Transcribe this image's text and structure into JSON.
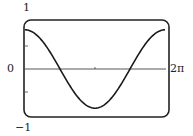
{
  "chart_data": {
    "type": "line",
    "title": "",
    "xlabel": "",
    "ylabel": "",
    "xlim": [
      0,
      6.283
    ],
    "ylim": [
      -1,
      1
    ],
    "x_tick_labels": [
      "0",
      "2π"
    ],
    "y_tick_labels": [
      "1",
      "0",
      "-1"
    ],
    "grid": false,
    "legend": "none",
    "series": [
      {
        "name": "f(x) ≈ 0.8cos(x)",
        "x": [
          0,
          0.785,
          1.571,
          2.356,
          3.142,
          3.927,
          4.712,
          5.498,
          6.283
        ],
        "values": [
          0.8,
          0.57,
          0.0,
          -0.57,
          -0.8,
          -0.57,
          0.0,
          0.57,
          0.8
        ]
      }
    ]
  },
  "labels": {
    "y_max": "1",
    "y_zero": "0",
    "y_min": "−1",
    "x_max": "2π"
  },
  "colors": {
    "curve": "#1a1a1a",
    "frame": "#222222",
    "axis": "#444444"
  }
}
